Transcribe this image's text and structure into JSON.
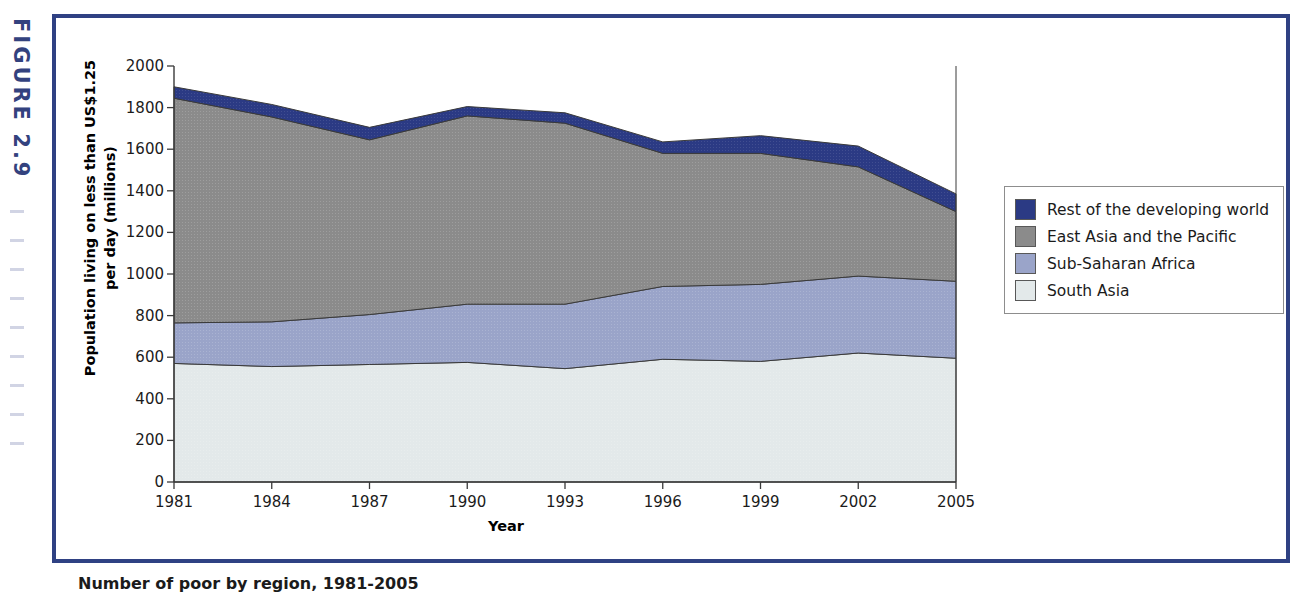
{
  "figure": {
    "tag": "FIGURE 2.9",
    "caption": "Number of poor by region, 1981-2005",
    "frame_color": "#2f4183"
  },
  "chart_data": {
    "type": "area",
    "stacked": true,
    "title": "",
    "xlabel": "Year",
    "ylabel": "Population living on less than US$1.25 per day (millions)",
    "ylabel_line1": "Population living on less than US$1.25",
    "ylabel_line2": "per day (millions)",
    "x": [
      1981,
      1984,
      1987,
      1990,
      1993,
      1996,
      1999,
      2002,
      2005
    ],
    "categories": [
      "1981",
      "1984",
      "1987",
      "1990",
      "1993",
      "1996",
      "1999",
      "2002",
      "2005"
    ],
    "xtick_labels": [
      "1981",
      "1984",
      "1987",
      "1990",
      "1993",
      "1996",
      "1999",
      "2002",
      "2005"
    ],
    "ytick_labels": [
      "0",
      "200",
      "400",
      "600",
      "800",
      "1000",
      "1200",
      "1400",
      "1600",
      "1800",
      "2000"
    ],
    "yticks": [
      0,
      200,
      400,
      600,
      800,
      1000,
      1200,
      1400,
      1600,
      1800,
      2000
    ],
    "ylim": [
      0,
      2000
    ],
    "xlim": [
      1981,
      2005
    ],
    "grid": false,
    "legend_position": "right",
    "series": [
      {
        "name": "South Asia",
        "color": "#e3e9ea",
        "values": [
          570,
          555,
          565,
          575,
          545,
          590,
          580,
          620,
          595
        ]
      },
      {
        "name": "Sub-Saharan Africa",
        "color": "#9aa4c9",
        "values": [
          195,
          215,
          240,
          280,
          310,
          350,
          370,
          370,
          370
        ]
      },
      {
        "name": "East Asia and the Pacific",
        "color": "#8b8b8b",
        "values": [
          1080,
          985,
          840,
          905,
          870,
          640,
          630,
          525,
          335
        ]
      },
      {
        "name": "Rest of the developing world",
        "color": "#2b3a84",
        "values": [
          55,
          60,
          60,
          45,
          50,
          55,
          85,
          100,
          85
        ]
      }
    ],
    "cumulative_totals": [
      1900,
      1815,
      1705,
      1805,
      1775,
      1635,
      1665,
      1615,
      1385
    ]
  },
  "legend": {
    "items": [
      {
        "label": "Rest of the developing world",
        "color": "#2b3a84"
      },
      {
        "label": "East Asia and the Pacific",
        "color": "#8b8b8b"
      },
      {
        "label": "Sub-Saharan Africa",
        "color": "#9aa4c9"
      },
      {
        "label": "South Asia",
        "color": "#e3e9ea"
      }
    ]
  }
}
